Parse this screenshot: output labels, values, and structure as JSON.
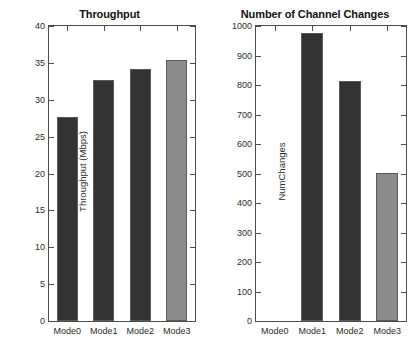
{
  "chart_data": [
    {
      "id": "throughput",
      "type": "bar",
      "title": "Throughput",
      "xlabel": "",
      "ylabel": "Throughput (Mbps)",
      "categories": [
        "Mode0",
        "Mode1",
        "Mode2",
        "Mode3"
      ],
      "values": [
        27.6,
        32.7,
        34.2,
        35.4
      ],
      "ylim": [
        0,
        40
      ],
      "yticks": [
        0,
        5,
        10,
        15,
        20,
        25,
        30,
        35,
        40
      ],
      "ytick_labels": [
        "0",
        "5",
        "10",
        "15",
        "20",
        "25",
        "30",
        "35",
        "40"
      ],
      "grid": false,
      "legend": "none",
      "bar_colors": [
        "#333333",
        "#333333",
        "#333333",
        "#8c8c8c"
      ]
    },
    {
      "id": "channel-changes",
      "type": "bar",
      "title": "Number of Channel Changes",
      "xlabel": "",
      "ylabel": "NumChanges",
      "categories": [
        "Mode0",
        "Mode1",
        "Mode2",
        "Mode3"
      ],
      "values": [
        0,
        976,
        815,
        502
      ],
      "ylim": [
        0,
        1000
      ],
      "yticks": [
        0,
        100,
        200,
        300,
        400,
        500,
        600,
        700,
        800,
        900,
        1000
      ],
      "ytick_labels": [
        "0",
        "100",
        "200",
        "300",
        "400",
        "500",
        "600",
        "700",
        "800",
        "900",
        "1000"
      ],
      "grid": false,
      "legend": "none",
      "bar_colors": [
        "#333333",
        "#333333",
        "#333333",
        "#8c8c8c"
      ]
    }
  ],
  "colors": {
    "bar_dark": "#333333",
    "bar_light": "#8c8c8c",
    "axis": "#4d4d4d",
    "text": "#2b2b2b",
    "background": "#ffffff"
  }
}
